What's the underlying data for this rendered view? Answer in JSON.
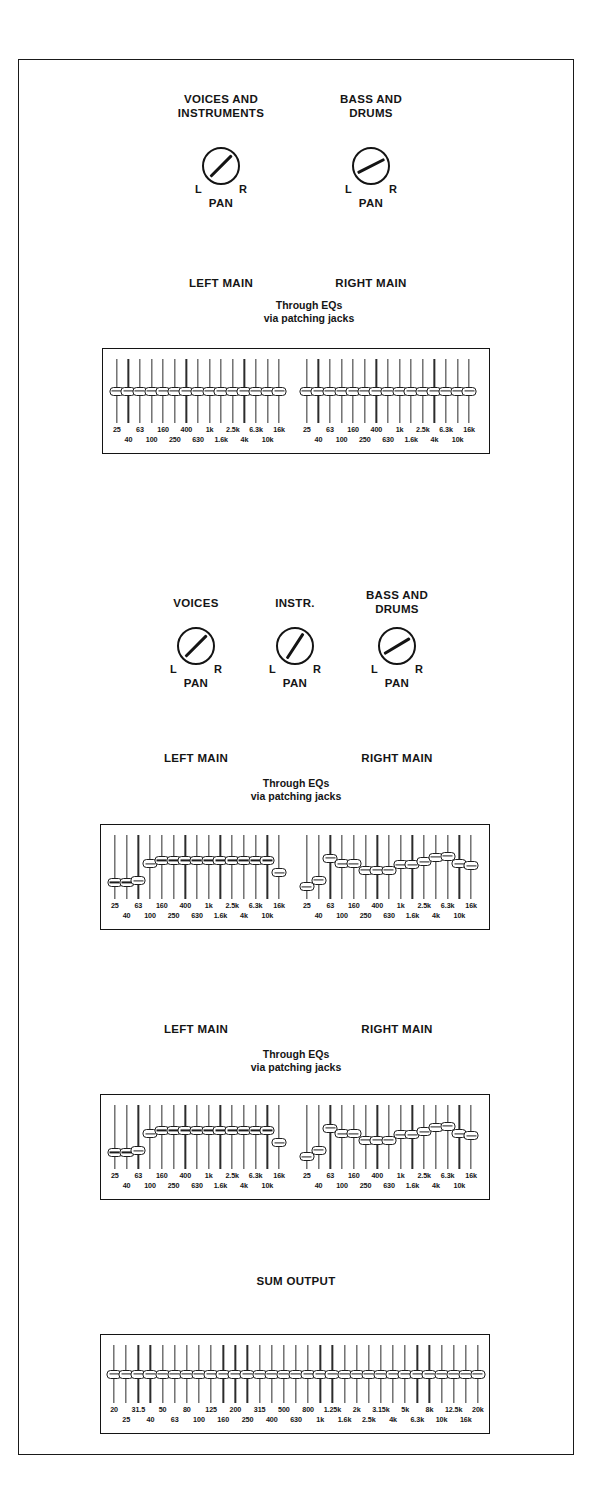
{
  "diagram": {
    "through_eq_note": "Through EQs\nvia patching jacks",
    "pan_label": "PAN",
    "pan_left": "L",
    "pan_right": "R",
    "line_color": "#141414"
  },
  "freq_bands_15": {
    "top": [
      "25",
      "63",
      "160",
      "400",
      "1k",
      "2.5k",
      "6.3k",
      "16k"
    ],
    "bottom": [
      "40",
      "100",
      "250",
      "630",
      "1.6k",
      "4k",
      "10k"
    ],
    "all": [
      "25",
      "40",
      "63",
      "100",
      "160",
      "250",
      "400",
      "630",
      "1k",
      "1.6k",
      "2.5k",
      "4k",
      "6.3k",
      "10k",
      "16k"
    ]
  },
  "freq_bands_31": {
    "top": [
      "20",
      "31.5",
      "50",
      "80",
      "125",
      "200",
      "315",
      "500",
      "800",
      "1.25k",
      "2k",
      "3.15k",
      "5k",
      "8k",
      "12.5k",
      "20k"
    ],
    "bottom": [
      "25",
      "40",
      "63",
      "100",
      "160",
      "250",
      "400",
      "630",
      "1k",
      "1.6k",
      "2.5k",
      "4k",
      "6.3k",
      "10k",
      "16k"
    ],
    "all": [
      "20",
      "25",
      "31.5",
      "40",
      "50",
      "63",
      "80",
      "100",
      "125",
      "160",
      "200",
      "250",
      "315",
      "400",
      "500",
      "630",
      "800",
      "1k",
      "1.25k",
      "1.6k",
      "2k",
      "2.5k",
      "3.15k",
      "4k",
      "5k",
      "6.3k",
      "8k",
      "10k",
      "12.5k",
      "16k",
      "20k"
    ]
  },
  "sections": [
    {
      "id": "section-1",
      "sources": [
        {
          "name": "source-voices-and-instruments",
          "label": "VOICES AND\nINSTRUMENTS",
          "pan_angle_deg": 0,
          "routes_to": [
            "LEFT MAIN"
          ]
        },
        {
          "name": "source-bass-and-drums",
          "label": "BASS AND\nDRUMS",
          "pan_angle_deg": 18,
          "routes_to": [
            "RIGHT MAIN"
          ]
        }
      ],
      "buses": [
        "LEFT MAIN",
        "RIGHT MAIN"
      ],
      "eq": {
        "bands": 15,
        "left_values": [
          50,
          50,
          50,
          50,
          50,
          50,
          50,
          50,
          50,
          50,
          50,
          50,
          50,
          50,
          50
        ],
        "right_values": [
          50,
          50,
          50,
          50,
          50,
          50,
          50,
          50,
          50,
          50,
          50,
          50,
          50,
          50,
          50
        ]
      }
    },
    {
      "id": "section-2",
      "sources": [
        {
          "name": "source-voices",
          "label": "VOICES",
          "pan_angle_deg": 0,
          "routes_to": [
            "LEFT MAIN"
          ]
        },
        {
          "name": "source-instr",
          "label": "INSTR.",
          "pan_angle_deg": -12,
          "routes_to": [
            "LEFT MAIN",
            "RIGHT MAIN"
          ]
        },
        {
          "name": "source-bass-and-drums",
          "label": "BASS AND\nDRUMS",
          "pan_angle_deg": 14,
          "routes_to": [
            "RIGHT MAIN"
          ]
        }
      ],
      "buses": [
        "LEFT MAIN",
        "RIGHT MAIN"
      ],
      "eq": {
        "bands": 15,
        "left_values": [
          22,
          22,
          25,
          56,
          62,
          62,
          62,
          62,
          62,
          62,
          62,
          62,
          62,
          62,
          40
        ],
        "right_values": [
          14,
          26,
          66,
          56,
          56,
          44,
          44,
          44,
          54,
          54,
          60,
          68,
          70,
          56,
          52
        ]
      }
    },
    {
      "id": "section-3",
      "sources": [],
      "buses": [
        "LEFT MAIN",
        "RIGHT MAIN"
      ],
      "eq": {
        "bands": 15,
        "left_values": [
          22,
          22,
          25,
          56,
          62,
          62,
          62,
          62,
          62,
          62,
          62,
          62,
          62,
          62,
          40
        ],
        "right_values": [
          14,
          26,
          66,
          56,
          56,
          44,
          44,
          44,
          54,
          54,
          60,
          68,
          70,
          56,
          52
        ]
      }
    },
    {
      "id": "section-4",
      "sum_label": "SUM OUTPUT",
      "eq": {
        "bands": 31,
        "values": [
          50,
          50,
          50,
          50,
          50,
          50,
          50,
          50,
          50,
          50,
          50,
          50,
          50,
          50,
          50,
          50,
          50,
          50,
          50,
          50,
          50,
          50,
          50,
          50,
          50,
          50,
          50,
          50,
          50,
          50,
          50
        ]
      }
    }
  ]
}
